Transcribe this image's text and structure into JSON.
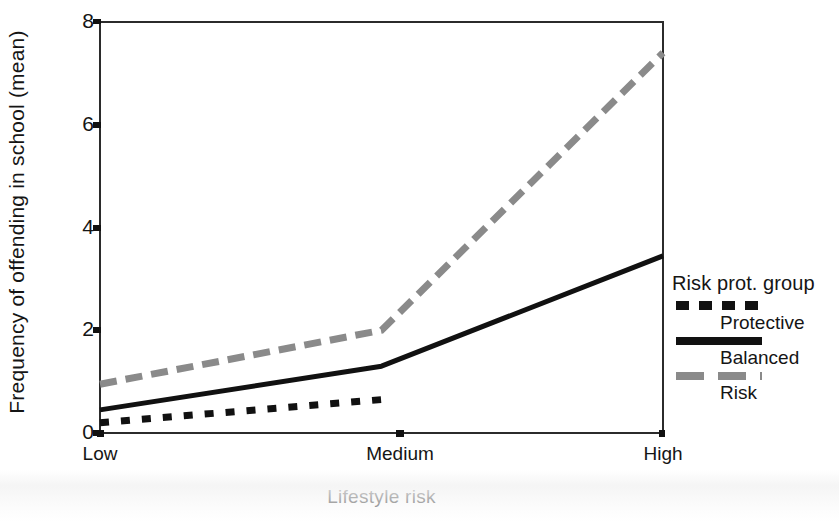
{
  "chart_data": {
    "type": "line",
    "title": "",
    "xlabel": "Lifestyle risk",
    "ylabel": "Frequency of offending in school (mean)",
    "categories": [
      "Low",
      "Medium",
      "High"
    ],
    "xtick_labels": [
      "Low",
      "Medium",
      "High"
    ],
    "ytick_labels": [
      "0",
      "2",
      "4",
      "6",
      "8"
    ],
    "yticks": [
      0,
      2,
      4,
      6,
      8
    ],
    "ylim": [
      0,
      8
    ],
    "grid": false,
    "legend_position": "right",
    "legend_title": "Risk prot. group",
    "series": [
      {
        "name": "Protective",
        "values": [
          0.2,
          0.65,
          null
        ],
        "color": "#111111",
        "style": "dotted"
      },
      {
        "name": "Balanced",
        "values": [
          0.45,
          1.3,
          3.45
        ],
        "color": "#111111",
        "style": "solid"
      },
      {
        "name": "Risk",
        "values": [
          0.95,
          2.0,
          7.4
        ],
        "color": "#8a8a8a",
        "style": "dashed"
      }
    ]
  },
  "legend": {
    "title": "Risk prot. group",
    "entries": [
      {
        "label": "Protective",
        "marker": "dotted-line-marker"
      },
      {
        "label": "Balanced",
        "marker": "solid-line-marker"
      },
      {
        "label": "Risk",
        "marker": "dashed-line-marker"
      }
    ]
  },
  "axes": {
    "y_title": "Frequency of offending in school (mean)",
    "x_title": "Lifestyle risk",
    "y_ticks": [
      "8",
      "6",
      "4",
      "2",
      "0"
    ],
    "x_ticks": [
      "Low",
      "Medium",
      "High"
    ]
  }
}
